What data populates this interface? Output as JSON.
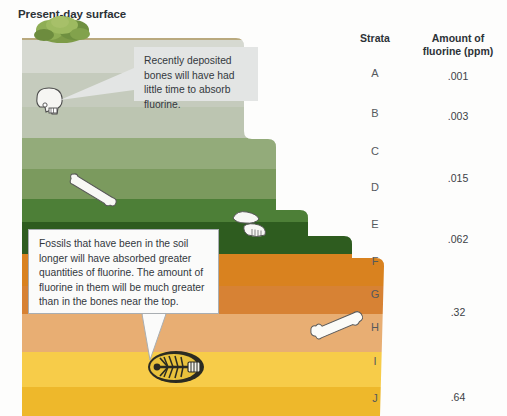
{
  "figure": {
    "title": "Present-day surface",
    "background_color": "#fdfdfc"
  },
  "table": {
    "strata_header": "Strata",
    "fluorine_header_line1": "Amount of",
    "fluorine_header_line2": "fluorine (ppm)",
    "rows": [
      {
        "strata": "A",
        "fluorine": ".001"
      },
      {
        "strata": "B",
        "fluorine": ".003"
      },
      {
        "strata": "C",
        "fluorine": ""
      },
      {
        "strata": "D",
        "fluorine": ".015"
      },
      {
        "strata": "E",
        "fluorine": ""
      },
      {
        "strata": "F",
        "fluorine": ".062"
      },
      {
        "strata": "G",
        "fluorine": ""
      },
      {
        "strata": "H",
        "fluorine": ".32"
      },
      {
        "strata": "I",
        "fluorine": ""
      },
      {
        "strata": "J",
        "fluorine": ".64"
      }
    ]
  },
  "callouts": [
    {
      "id": "recent-bones",
      "text": "Recently deposited bones will have had little time to absorb fluorine.",
      "background_color": "#e3e5e4"
    },
    {
      "id": "older-fossils",
      "text": "Fossils that have been in the soil longer will have absorbed greater quantities of fluorine. The amount of fluorine in them will be much greater than in the bones near the top.",
      "background_color": "#fbfbfa",
      "border_color": "#a9aeb2"
    }
  ],
  "soil_layers": [
    {
      "name": "topsoil-crust",
      "color": "#b9a97e"
    },
    {
      "name": "layer-a",
      "color": "#d3d6cd"
    },
    {
      "name": "layer-b",
      "color": "#c6ccbd"
    },
    {
      "name": "layer-c",
      "color": "#b3bfa6"
    },
    {
      "name": "layer-d",
      "color": "#8aa472"
    },
    {
      "name": "layer-e",
      "color": "#6b8f4e"
    },
    {
      "name": "layer-f",
      "color": "#4a7a34"
    },
    {
      "name": "layer-g",
      "color": "#2f5d20"
    },
    {
      "name": "layer-h",
      "color": "#d9821f"
    },
    {
      "name": "layer-i",
      "color": "#d6853a"
    },
    {
      "name": "layer-j",
      "color": "#e8b071"
    },
    {
      "name": "layer-k",
      "color": "#f6cd4c"
    },
    {
      "name": "layer-l",
      "color": "#f0b92c"
    }
  ],
  "fossils": [
    {
      "name": "skull",
      "layer": "layer-b",
      "depth_label": "near surface"
    },
    {
      "name": "long-bone",
      "layer": "layer-e",
      "depth_label": "mid depth"
    },
    {
      "name": "jawbone",
      "layer": "layer-g",
      "depth_label": "deep"
    },
    {
      "name": "femur",
      "layer": "layer-j",
      "depth_label": "deeper"
    },
    {
      "name": "fish-skeleton",
      "layer": "layer-k",
      "depth_label": "deepest"
    }
  ],
  "vegetation": {
    "name": "shrub",
    "color": "#7fa048"
  }
}
